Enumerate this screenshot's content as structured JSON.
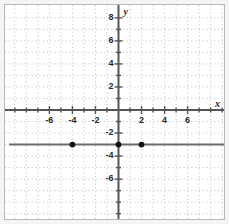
{
  "figure": {
    "kind": "coordinate-plane",
    "background_color": "#ffffff",
    "frame_color": "#b9b9b9",
    "grid_color": "#c8c8c8",
    "axis_color": "#555555",
    "line_color": "#6b6b6b",
    "point_color": "#111111"
  },
  "axes": {
    "x_label": "x",
    "y_label": "y",
    "x_ticks": [
      {
        "value": -6,
        "label": "-6"
      },
      {
        "value": -4,
        "label": "-4"
      },
      {
        "value": -2,
        "label": "-2"
      },
      {
        "value": 2,
        "label": "2"
      },
      {
        "value": 4,
        "label": "4"
      },
      {
        "value": 6,
        "label": "6"
      }
    ],
    "y_ticks": [
      {
        "value": 8,
        "label": "8"
      },
      {
        "value": 6,
        "label": "6"
      },
      {
        "value": 4,
        "label": "4"
      },
      {
        "value": 2,
        "label": "2"
      },
      {
        "value": -2,
        "label": "-2"
      },
      {
        "value": -4,
        "label": "-4"
      },
      {
        "value": -6,
        "label": "-6"
      }
    ]
  },
  "chart_data": {
    "type": "line",
    "title": "",
    "xlabel": "x",
    "ylabel": "y",
    "xlim": [
      -9.5,
      9.5
    ],
    "ylim": [
      -9.0,
      8.8
    ],
    "grid": true,
    "grid_step": 1,
    "legend": "none",
    "series": [
      {
        "name": "y = -3",
        "kind": "horizontal-line",
        "y": -3,
        "x_from": -9.5,
        "x_to": 9.5,
        "style": "solid"
      }
    ],
    "points": [
      {
        "x": -4,
        "y": -3,
        "label": "(-4, -3)"
      },
      {
        "x": 0,
        "y": -3,
        "label": "(0, -3)"
      },
      {
        "x": 2,
        "y": -3,
        "label": "(2, -3)"
      }
    ],
    "categories": [
      -4,
      0,
      2
    ],
    "values": [
      -3,
      -3,
      -3
    ]
  }
}
